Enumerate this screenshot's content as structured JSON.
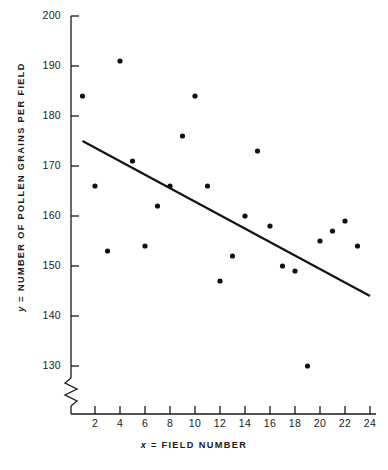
{
  "chart_data": {
    "type": "scatter",
    "title": "",
    "xlabel": "x = FIELD NUMBER",
    "ylabel": "y = NUMBER OF POLLEN GRAINS PER FIELD",
    "xlabel_prefix": "x",
    "xlabel_rest": " =  FIELD  NUMBER",
    "ylabel_prefix": "y",
    "ylabel_rest": " =  NUMBER  OF  POLLEN  GRAINS  PER  FIELD",
    "xlim": [
      0,
      24.5
    ],
    "ylim": [
      125,
      200
    ],
    "xticks": [
      2,
      4,
      6,
      8,
      10,
      12,
      14,
      16,
      18,
      20,
      22,
      24
    ],
    "yticks": [
      130,
      140,
      150,
      160,
      170,
      180,
      190,
      200
    ],
    "grid": false,
    "legend": null,
    "y_axis_break": true,
    "x_axis_break": false,
    "axis_color": "#1a1a1a",
    "marker_color": "#111111",
    "line_color": "#111111",
    "x": [
      1,
      2,
      3,
      4,
      5,
      6,
      7,
      8,
      9,
      10,
      11,
      12,
      13,
      14,
      15,
      16,
      17,
      18,
      19,
      20,
      21,
      22,
      23
    ],
    "y": [
      184,
      166,
      153,
      191,
      171,
      154,
      162,
      166,
      176,
      184,
      166,
      147,
      152,
      160,
      173,
      158,
      150,
      149,
      130,
      155,
      157,
      159,
      154
    ],
    "points": [
      {
        "x": 1,
        "y": 184
      },
      {
        "x": 2,
        "y": 166
      },
      {
        "x": 3,
        "y": 153
      },
      {
        "x": 4,
        "y": 191
      },
      {
        "x": 5,
        "y": 171
      },
      {
        "x": 6,
        "y": 154
      },
      {
        "x": 7,
        "y": 162
      },
      {
        "x": 8,
        "y": 166
      },
      {
        "x": 9,
        "y": 176
      },
      {
        "x": 10,
        "y": 184
      },
      {
        "x": 11,
        "y": 166
      },
      {
        "x": 12,
        "y": 147
      },
      {
        "x": 13,
        "y": 152
      },
      {
        "x": 14,
        "y": 160
      },
      {
        "x": 15,
        "y": 173
      },
      {
        "x": 16,
        "y": 158
      },
      {
        "x": 17,
        "y": 150
      },
      {
        "x": 18,
        "y": 149
      },
      {
        "x": 19,
        "y": 130
      },
      {
        "x": 20,
        "y": 155
      },
      {
        "x": 21,
        "y": 157
      },
      {
        "x": 22,
        "y": 159
      },
      {
        "x": 23,
        "y": 154
      }
    ],
    "regression_line": {
      "x_start": 1,
      "y_start": 175,
      "x_end": 24,
      "y_end": 144
    }
  }
}
